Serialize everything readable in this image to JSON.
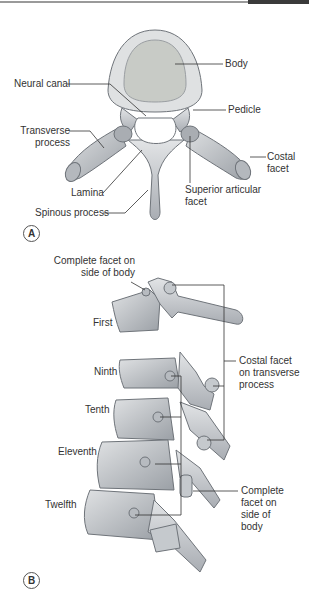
{
  "figure_a": {
    "panel_label": "A",
    "labels": {
      "body": "Body",
      "neural_canal": "Neural canal",
      "pedicle": "Pedicle",
      "transverse_process": "Transverse process",
      "costal_facet": "Costal facet",
      "lamina": "Lamina",
      "superior_articular_facet": "Superior articular facet",
      "spinous_process": "Spinous process"
    }
  },
  "figure_b": {
    "panel_label": "B",
    "labels": {
      "complete_facet_top": "Complete facet on side of body",
      "first": "First",
      "ninth": "Ninth",
      "tenth": "Tenth",
      "eleventh": "Eleventh",
      "twelfth": "Twelfth",
      "costal_facet_transverse": "Costal facet on transverse process",
      "complete_facet_bottom": "Complete facet on side of body"
    }
  },
  "colors": {
    "bone_light": "#d9dcdf",
    "bone_mid": "#b8bcc1",
    "bone_dark": "#8e9399",
    "body_fill": "#c9ccc8",
    "line": "#333333"
  }
}
